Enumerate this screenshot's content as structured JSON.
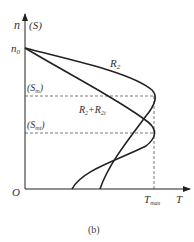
{
  "figure": {
    "caption": "(b)",
    "axes": {
      "y_label": "n",
      "y_label_alt": "(S)",
      "x_label": "T",
      "origin": "O"
    },
    "y_markers": [
      {
        "id": "n0",
        "label": "n",
        "sub": "0",
        "y": 48
      },
      {
        "id": "Sm",
        "label": "(S",
        "sub": "m",
        "close": ")",
        "y": 96
      },
      {
        "id": "Smt",
        "label": "(S",
        "sub": "mt",
        "close": ")",
        "y": 133
      }
    ],
    "x_markers": [
      {
        "id": "Tmax",
        "label": "T",
        "sub": "max",
        "x": 154
      }
    ],
    "curves": [
      {
        "id": "R2",
        "label": "R",
        "sub": "2",
        "peak_y": 96
      },
      {
        "id": "R2_R2t",
        "label": "R",
        "sub": "2",
        "plus": "+R",
        "sub2": "2t",
        "peak_y": 133
      }
    ],
    "colors": {
      "axis": "#222222",
      "curve": "#222222",
      "dashed": "#555555",
      "text": "#333333"
    }
  }
}
